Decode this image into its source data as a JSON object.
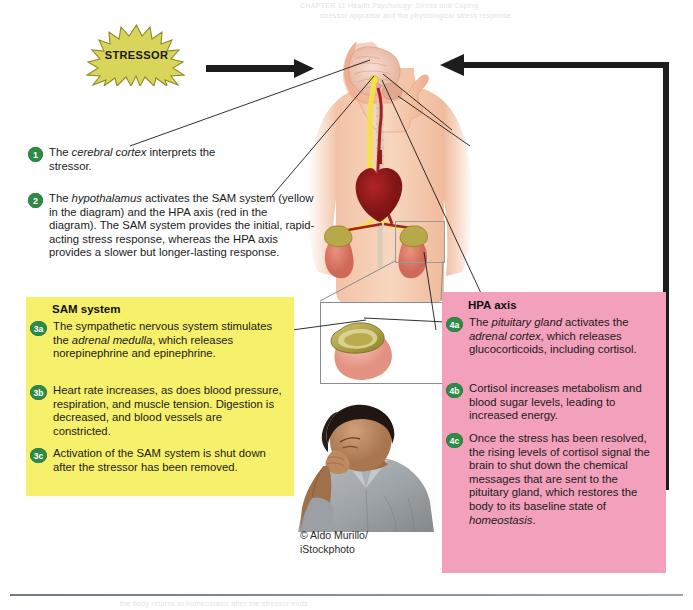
{
  "figure": {
    "stressor_label": "STRESSOR",
    "credit_line1": "© Aldo Murillo/",
    "credit_line2": "iStockphoto"
  },
  "steps": [
    {
      "id": "1",
      "html": "The <i>cerebral cortex</i> interprets the stressor."
    },
    {
      "id": "2",
      "html": "The <i>hypothalamus</i> activates the SAM system (yellow in the diagram) and the HPA axis (red in the diagram). The SAM system provides the initial, rapid-acting stress response, whereas the HPA axis provides a slower but longer-lasting response."
    }
  ],
  "sam_panel": {
    "title": "SAM system",
    "color": "#f7f06a",
    "items": [
      {
        "id": "3a",
        "html": "The sympathetic nervous system stimulates the <i>adrenal medulla</i>, which releases norepinephrine and epinephrine."
      },
      {
        "id": "3b",
        "html": "Heart rate increases, as does blood pressure, respiration, and muscle tension. Digestion is decreased, and blood vessels are constricted."
      },
      {
        "id": "3c",
        "html": "Activation of the SAM system is shut down after the stressor has been removed."
      }
    ]
  },
  "hpa_panel": {
    "title": "HPA axis",
    "color": "#f2a0bb",
    "items": [
      {
        "id": "4a",
        "html": "The <i>pituitary gland</i> activates the <i>adrenal cortex</i>, which releases glucocorticoids, including cortisol."
      },
      {
        "id": "4b",
        "html": "Cortisol increases metabolism and blood sugar levels, leading to increased energy."
      },
      {
        "id": "4c",
        "html": "Once the stress has been resolved, the rising levels of cortisol signal the brain to shut down the chemical messages that are sent to the pituitary gland, which restores the body to its baseline state of <i>homeostasis</i>."
      }
    ]
  },
  "ghost_text": [
    "CHAPTER 11  Health Psychology: Stress and Coping",
    "stressor appraisal and the physiological stress response",
    "the body returns to homeostasis after the stressor ends"
  ],
  "colors": {
    "bullet_green": "#2f8a48",
    "starburst_fill": "#d9d45a",
    "sam_yellow": "#f7f06a",
    "hpa_pink": "#f2a0bb",
    "arrow_black": "#1d1d1d"
  }
}
